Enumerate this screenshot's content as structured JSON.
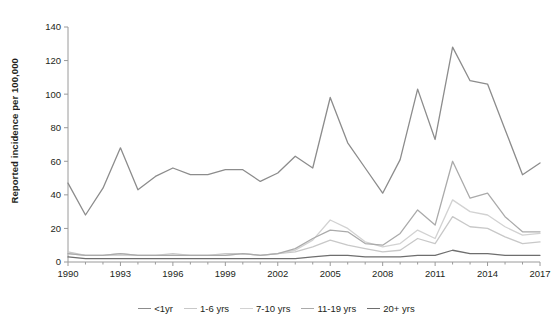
{
  "chart_data": {
    "type": "line",
    "title": "",
    "xlabel": "",
    "ylabel": "Reported incidence per 100,000",
    "xlim": [
      1990,
      2017
    ],
    "ylim": [
      0,
      140
    ],
    "yticks": [
      0,
      20,
      40,
      60,
      80,
      100,
      120,
      140
    ],
    "xticks": [
      1990,
      1993,
      1996,
      1999,
      2002,
      2005,
      2008,
      2011,
      2014,
      2017
    ],
    "grid": false,
    "legend_position": "bottom",
    "x": [
      1990,
      1991,
      1992,
      1993,
      1994,
      1995,
      1996,
      1997,
      1998,
      1999,
      2000,
      2001,
      2002,
      2003,
      2004,
      2005,
      2006,
      2007,
      2008,
      2009,
      2010,
      2011,
      2012,
      2013,
      2014,
      2015,
      2016,
      2017
    ],
    "series": [
      {
        "name": "<1yr",
        "color": "#8c8c8c",
        "values": [
          47,
          28,
          44,
          68,
          43,
          51,
          56,
          52,
          52,
          55,
          55,
          48,
          53,
          63,
          56,
          98,
          71,
          56,
          41,
          61,
          103,
          73,
          128,
          108,
          106,
          79,
          52,
          59
        ]
      },
      {
        "name": "1-6 yrs",
        "color": "#c8c8c8",
        "values": [
          6,
          4,
          4,
          5,
          4,
          4,
          5,
          4,
          4,
          5,
          5,
          4,
          5,
          6,
          9,
          13,
          10,
          8,
          6,
          7,
          14,
          11,
          27,
          21,
          20,
          15,
          11,
          12
        ]
      },
      {
        "name": "7-10 yrs",
        "color": "#d2d2d2",
        "values": [
          5,
          4,
          4,
          4,
          4,
          4,
          4,
          4,
          4,
          4,
          5,
          4,
          5,
          7,
          13,
          25,
          20,
          12,
          9,
          11,
          19,
          14,
          37,
          30,
          28,
          21,
          16,
          17
        ]
      },
      {
        "name": "11-19 yrs",
        "color": "#aaaaaa",
        "values": [
          5,
          4,
          4,
          5,
          4,
          4,
          4,
          4,
          4,
          4,
          5,
          4,
          5,
          8,
          14,
          19,
          18,
          11,
          10,
          17,
          31,
          22,
          60,
          38,
          41,
          27,
          18,
          18
        ]
      },
      {
        "name": "20+ yrs",
        "color": "#6e6e6e",
        "values": [
          3,
          2,
          2,
          2,
          2,
          2,
          2,
          2,
          2,
          2,
          2,
          2,
          2,
          2,
          3,
          4,
          4,
          3,
          3,
          3,
          4,
          4,
          7,
          5,
          5,
          4,
          4,
          4
        ]
      }
    ]
  },
  "axis": {
    "y_title": "Reported incidence per 100,000"
  },
  "legend": {
    "items": [
      {
        "label": "<1yr"
      },
      {
        "label": "1-6 yrs"
      },
      {
        "label": "7-10 yrs"
      },
      {
        "label": "11-19 yrs"
      },
      {
        "label": "20+ yrs"
      }
    ]
  }
}
